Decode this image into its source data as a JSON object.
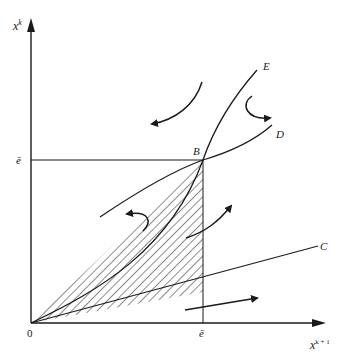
{
  "axes": {
    "y_label": "x",
    "y_label_sup": "k",
    "x_label": "x",
    "x_label_sup": "k + 1",
    "origin_label": "0"
  },
  "ticks": {
    "y_tick_label": "ē",
    "x_tick_label": "ē"
  },
  "curves": {
    "point_B": "B",
    "curve_E": "E",
    "curve_D": "D",
    "curve_C": "C"
  },
  "colors": {
    "ink": "#1a1a1a",
    "background": "#ffffff"
  }
}
